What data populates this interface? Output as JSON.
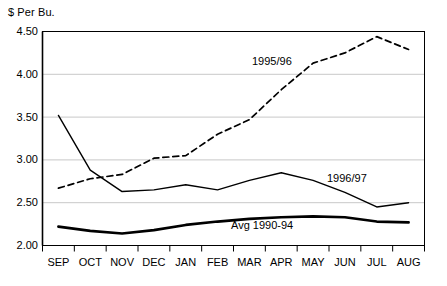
{
  "chart_data": {
    "type": "line",
    "title": "",
    "xlabel": "",
    "ylabel": "$ Per Bu.",
    "categories": [
      "SEP",
      "OCT",
      "NOV",
      "DEC",
      "JAN",
      "FEB",
      "MAR",
      "APR",
      "MAY",
      "JUN",
      "JUL",
      "AUG"
    ],
    "ylim": [
      2.0,
      4.5
    ],
    "ytick_labels": [
      "4.50",
      "4.00",
      "3.50",
      "3.00",
      "2.50",
      "2.00"
    ],
    "ytick_values": [
      4.5,
      4.0,
      3.5,
      3.0,
      2.5,
      2.0
    ],
    "grid": "horizontal",
    "legend_position": "inline-annotations",
    "series": [
      {
        "name": "1995/96",
        "style": "dashed",
        "color": "#000000",
        "values": [
          2.67,
          2.78,
          2.83,
          3.02,
          3.05,
          3.3,
          3.47,
          3.82,
          4.13,
          4.25,
          4.44,
          4.29
        ]
      },
      {
        "name": "1996/97",
        "style": "solid",
        "color": "#000000",
        "values": [
          3.52,
          2.88,
          2.63,
          2.65,
          2.71,
          2.65,
          2.76,
          2.85,
          2.76,
          2.62,
          2.45,
          2.5
        ]
      },
      {
        "name": "Avg 1990-94",
        "style": "solid-bold",
        "color": "#000000",
        "values": [
          2.22,
          2.17,
          2.14,
          2.18,
          2.24,
          2.28,
          2.31,
          2.33,
          2.34,
          2.33,
          2.28,
          2.27
        ]
      }
    ]
  },
  "axis": {
    "y_title": "$ Per Bu."
  },
  "annotations": {
    "series_1995_96": "1995/96",
    "series_1996_97": "1996/97",
    "series_avg": "Avg 1990-94"
  },
  "colors": {
    "axis": "#000000",
    "grid": "#c8c8c8",
    "plot_background": "#ffffff"
  }
}
